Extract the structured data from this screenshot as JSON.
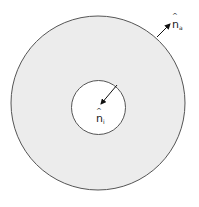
{
  "diagram": {
    "colors": {
      "background": "#ffffff",
      "annulus_fill": "#ececec",
      "stroke": "#555555",
      "arrow": "#111111"
    },
    "outer_circle": {
      "cx": 98,
      "cy": 103,
      "r": 87
    },
    "inner_circle": {
      "cx": 98.5,
      "cy": 107.5,
      "r": 27
    },
    "labels": {
      "outer_normal": {
        "base": "n",
        "hat": "^",
        "subscript": "a"
      },
      "inner_normal": {
        "base": "n",
        "hat": "^",
        "subscript": "i"
      }
    }
  }
}
